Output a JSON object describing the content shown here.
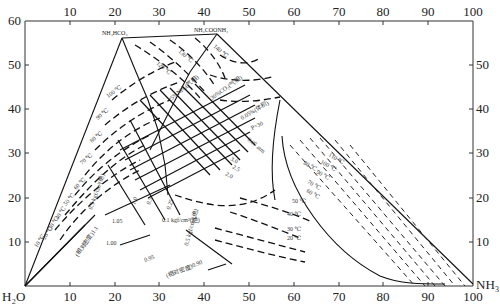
{
  "diagram": {
    "type": "ternary-style phase diagram (NH3–CO2–H2O system)",
    "x_axis": {
      "ticks_bottom": [
        "10",
        "20",
        "30",
        "40",
        "50",
        "60",
        "70",
        "80",
        "90",
        "100"
      ],
      "ticks_top": [
        "10",
        "20",
        "30",
        "40",
        "50",
        "60",
        "70",
        "80",
        "90",
        "100"
      ],
      "left_end_label": "H₂O",
      "right_end_label": "NH₃"
    },
    "y_axis": {
      "ticks_left": [
        "10",
        "20",
        "30",
        "40",
        "50",
        "60"
      ],
      "ticks_right": [
        "10",
        "20",
        "30",
        "40",
        "50"
      ]
    },
    "apex_labels": {
      "nh4hco3": "NH₄HCO₃",
      "nh2coonh4": "NH₂COONH₄"
    },
    "isotherm_labels_left": [
      "10 ℃",
      "20 ℃",
      "30 ℃",
      "40 ℃",
      "50 ℃",
      "60 ℃",
      "70 ℃",
      "80 ℃",
      "90 ℃",
      "100 ℃",
      "120 ℃",
      "130 ℃",
      "140 ℃"
    ],
    "isotherm_labels_right": [
      "110 ℃",
      "100 ℃",
      "90 ℃",
      "80 ℃",
      "70 ℃",
      "60 ℃",
      "50 ℃",
      "40 ℃",
      "30 ℃",
      "20 ℃"
    ],
    "density_labels": [
      "(相对密度)1.1",
      "(相对密度)0.90",
      "1.05",
      "1.00",
      "0.95"
    ],
    "pressure_labels": [
      "0.5 kgf/cm²(绝)",
      "0.1 kgf/cm²(绝)",
      "0.25",
      "0.5",
      "1.0",
      "1.5",
      "2.0",
      "2.5",
      "3.0",
      "P=30",
      "0.05 atm",
      "气相"
    ],
    "region_labels": [
      "25%NH₃(气相)",
      "30%CO₂(气相)",
      "0.05%(体积)",
      "(液)",
      "均"
    ]
  }
}
